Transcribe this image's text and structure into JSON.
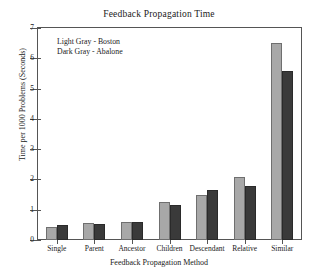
{
  "chart_data": {
    "type": "bar",
    "title": "Feedback Propagation Time",
    "xlabel": "Feedback Propagation Method",
    "ylabel": "Time per 1000 Problems (Seconds)",
    "categories": [
      "Single",
      "Parent",
      "Ancestor",
      "Children",
      "Descendant",
      "Relative",
      "Similar"
    ],
    "series": [
      {
        "name": "Boston",
        "color": "#a8a8a8",
        "values": [
          0.42,
          0.55,
          0.58,
          1.25,
          1.47,
          2.08,
          6.5
        ]
      },
      {
        "name": "Abalone",
        "color": "#3a3a3a",
        "values": [
          0.48,
          0.53,
          0.6,
          1.15,
          1.65,
          1.8,
          5.57
        ]
      }
    ],
    "ylim": [
      0,
      7
    ],
    "yticks": [
      0,
      1,
      2,
      3,
      4,
      5,
      6,
      7
    ],
    "ytick_labels": [
      "0",
      "1",
      "2",
      "3",
      "4",
      "5",
      "6",
      "7"
    ],
    "grid": false,
    "legend_position": "upper-left-inside"
  },
  "legend": {
    "entries": [
      {
        "text": "Light Gray - Boston"
      },
      {
        "text": "Dark Gray - Abalone"
      }
    ]
  },
  "colors": {
    "light_bar": "#a8a8a8",
    "dark_bar": "#3a3a3a",
    "axis": "#555555",
    "text": "#1a1a1a",
    "background": "#ffffff"
  }
}
